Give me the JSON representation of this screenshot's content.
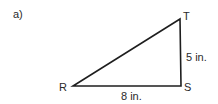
{
  "figure": {
    "part_label": "a)",
    "shape": "right triangle",
    "vertices": {
      "R": {
        "label": "R"
      },
      "S": {
        "label": "S"
      },
      "T": {
        "label": "T"
      }
    },
    "sides": {
      "RS": {
        "label": "8 in."
      },
      "ST": {
        "label": "5 in."
      }
    },
    "right_angle_at": "S",
    "colors": {
      "stroke": "#1e1e1e",
      "text": "#2a2a2a",
      "background": "#ffffff"
    }
  }
}
